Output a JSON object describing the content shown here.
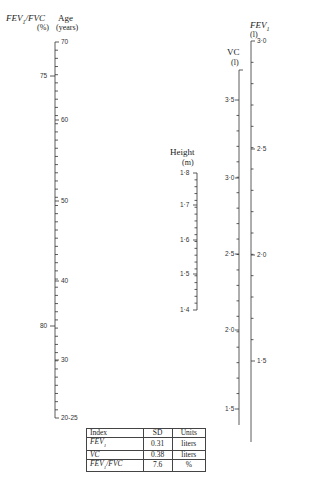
{
  "chart_data": {
    "type": "nomogram",
    "title": "",
    "axes": [
      {
        "name": "FEV1/FVC",
        "unit": "(%)",
        "ticks": [
          {
            "label": "75",
            "y": 76
          },
          {
            "label": "80",
            "y": 326
          }
        ]
      },
      {
        "name": "Age",
        "unit": "(years)",
        "ticks": [
          {
            "label": "70",
            "y": 42
          },
          {
            "label": "60",
            "y": 120
          },
          {
            "label": "50",
            "y": 201
          },
          {
            "label": "40",
            "y": 281
          },
          {
            "label": "30",
            "y": 360
          },
          {
            "label": "20-25",
            "y": 418
          }
        ]
      },
      {
        "name": "Height",
        "unit": "(m)",
        "ticks": [
          {
            "label": "1·8",
            "y": 173
          },
          {
            "label": "1·7",
            "y": 205
          },
          {
            "label": "1·6",
            "y": 240
          },
          {
            "label": "1·5",
            "y": 274
          },
          {
            "label": "1·4",
            "y": 310
          }
        ]
      },
      {
        "name": "VC",
        "unit": "(l)",
        "ticks": [
          {
            "label": "3·5",
            "y": 100
          },
          {
            "label": "3·0",
            "y": 178
          },
          {
            "label": "2·5",
            "y": 254
          },
          {
            "label": "2·0",
            "y": 330
          },
          {
            "label": "1·5",
            "y": 409
          }
        ]
      },
      {
        "name": "FEV1",
        "unit": "(l)",
        "ticks": [
          {
            "label": "3·0",
            "y": 41
          },
          {
            "label": "2·5",
            "y": 149
          },
          {
            "label": "2·0",
            "y": 255
          },
          {
            "label": "1·5",
            "y": 361
          }
        ]
      }
    ],
    "table": {
      "columns": [
        "Index",
        "SD",
        "Units"
      ],
      "rows": [
        [
          "FEV1",
          "0.31",
          "liters"
        ],
        [
          "VC",
          "0.38",
          "liters"
        ],
        [
          "FEV1/FVC",
          "7.6",
          "%"
        ]
      ]
    }
  },
  "labels": {
    "fevfvc_title": "FEV",
    "fevfvc_sub": "1",
    "fevfvc_rest": "/FVC",
    "fevfvc_unit": "(%)",
    "age_title": "Age",
    "age_unit": "(years)",
    "height_title": "Height",
    "height_unit": "(m)",
    "vc_title": "VC",
    "vc_unit": "(l)",
    "fev1_title": "FEV",
    "fev1_sub": "1",
    "fev1_unit": "(l)"
  },
  "ticks": {
    "fevfvc": [
      "75",
      "80"
    ],
    "age": [
      "70",
      "60",
      "50",
      "40",
      "30",
      "20-25"
    ],
    "height": [
      "1·8",
      "1·7",
      "1·6",
      "1·5",
      "1·4"
    ],
    "vc": [
      "3·5",
      "3·0",
      "2·5",
      "2·0",
      "1·5"
    ],
    "fev1": [
      "3·0",
      "2·5",
      "2·0",
      "1·5"
    ]
  },
  "table": {
    "headers": [
      "Index",
      "SD",
      "Units"
    ],
    "rows": [
      {
        "index": "FEV",
        "sub": "1",
        "rest": "",
        "sd": "0.31",
        "units": "liters"
      },
      {
        "index": "VC",
        "sub": "",
        "rest": "",
        "sd": "0.38",
        "units": "liters"
      },
      {
        "index": "FEV",
        "sub": "1",
        "rest": "/FVC",
        "sd": "7.6",
        "units": "%"
      }
    ]
  }
}
